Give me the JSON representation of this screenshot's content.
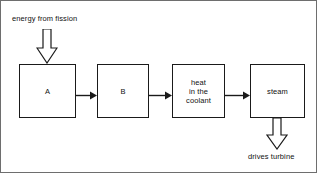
{
  "diagram": {
    "line_color": "#1a1a1a",
    "frame_color": "#6e6e6e",
    "background": "#ffffff",
    "boxes": [
      {
        "id": "a",
        "label": "A"
      },
      {
        "id": "b",
        "label": "B"
      },
      {
        "id": "heat",
        "label": "heat\nin the\ncoolant"
      },
      {
        "id": "steam",
        "label": "steam"
      }
    ],
    "captions": {
      "input": "energy from fission",
      "output": "drives turbine"
    },
    "icons": {
      "arrow_in": "block-arrow-down-icon",
      "arrow_out": "block-arrow-down-icon",
      "connector": "arrow-right-icon"
    }
  }
}
